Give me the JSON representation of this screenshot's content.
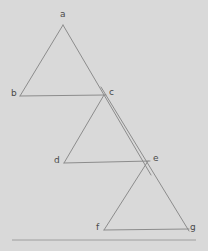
{
  "figure": {
    "background_color": "#d9d9d9",
    "stroke_color": "#8c8c8c",
    "baseline_color": "#9e9e9e",
    "label_color": "#4a4a4a",
    "stroke_width": 1,
    "width": 208,
    "height": 251,
    "vertices": [
      {
        "id": "a",
        "label": "a",
        "x": 63,
        "y": 25,
        "label_x": 60,
        "label_y": 10
      },
      {
        "id": "b",
        "label": "b",
        "x": 20,
        "y": 96,
        "label_x": 11,
        "label_y": 89
      },
      {
        "id": "c",
        "label": "c",
        "x": 104,
        "y": 95,
        "label_x": 109,
        "label_y": 88
      },
      {
        "id": "d",
        "label": "d",
        "x": 64,
        "y": 163,
        "label_x": 54,
        "label_y": 156
      },
      {
        "id": "e",
        "label": "e",
        "x": 148,
        "y": 161,
        "label_x": 153,
        "label_y": 154
      },
      {
        "id": "f",
        "label": "f",
        "x": 104,
        "y": 230,
        "label_x": 96,
        "label_y": 223
      },
      {
        "id": "g",
        "label": "g",
        "x": 187,
        "y": 229,
        "label_x": 190,
        "label_y": 223
      }
    ],
    "edges": [
      {
        "id": "edge-a-b",
        "from": "a",
        "to": "b",
        "x1": 63,
        "y1": 25,
        "x2": 20,
        "y2": 96
      },
      {
        "id": "edge-b-c",
        "from": "b",
        "to": "c",
        "x1": 20,
        "y1": 96,
        "x2": 106,
        "y2": 95
      },
      {
        "id": "edge-a-e",
        "from": "a",
        "to": "e",
        "x1": 63,
        "y1": 25,
        "x2": 151,
        "y2": 175
      },
      {
        "id": "edge-c-d",
        "from": "c",
        "to": "d",
        "x1": 104,
        "y1": 95,
        "x2": 64,
        "y2": 163
      },
      {
        "id": "edge-d-e",
        "from": "d",
        "to": "e",
        "x1": 64,
        "y1": 163,
        "x2": 150,
        "y2": 161
      },
      {
        "id": "edge-c-g",
        "from": "c",
        "to": "g",
        "x1": 101,
        "y1": 87,
        "x2": 189,
        "y2": 231
      },
      {
        "id": "edge-e-f",
        "from": "e",
        "to": "f",
        "x1": 148,
        "y1": 161,
        "x2": 104,
        "y2": 230
      },
      {
        "id": "edge-f-g",
        "from": "f",
        "to": "g",
        "x1": 104,
        "y1": 230,
        "x2": 189,
        "y2": 229
      }
    ],
    "baseline": {
      "id": "baseline",
      "x1": 12,
      "y1": 240,
      "x2": 196,
      "y2": 240
    }
  }
}
